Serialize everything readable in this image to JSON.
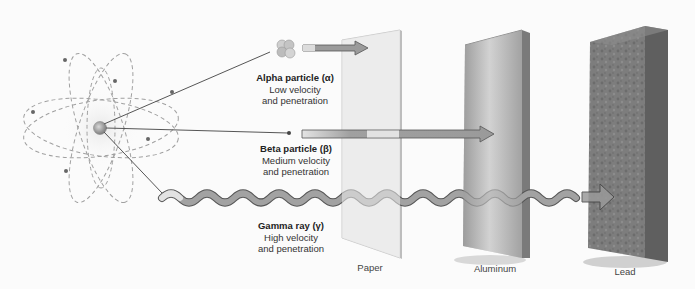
{
  "diagram": {
    "source": {
      "name": "Radioactive atom",
      "icon": "atom-icon"
    },
    "radiations": [
      {
        "name": "Alpha particle (α)",
        "line1": "Low velocity",
        "line2": "and penetration",
        "stopped_by": "Paper"
      },
      {
        "name": "Beta particle (β)",
        "line1": "Medium velocity",
        "line2": "and penetration",
        "stopped_by": "Aluminum"
      },
      {
        "name": "Gamma ray (γ)",
        "line1": "High velocity",
        "line2": "and penetration",
        "stopped_by": "Lead"
      }
    ],
    "barriers": [
      {
        "label": "Paper",
        "color": "#e6e6e6"
      },
      {
        "label": "Aluminum",
        "color": "#a8a8a8"
      },
      {
        "label": "Lead",
        "color": "#7a7a7a"
      }
    ],
    "colors": {
      "background": "#fbfbfb",
      "beam": "#9a9a9a",
      "beam_outline": "#555555",
      "orbit": "#9c9c9c"
    }
  }
}
